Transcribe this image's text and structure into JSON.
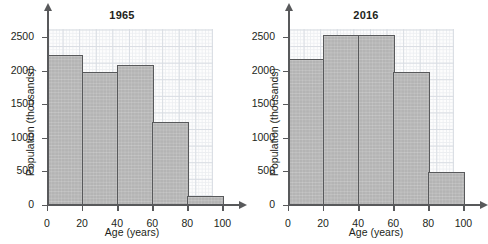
{
  "figure": {
    "panels": [
      {
        "title": "1965",
        "xlabel": "Age (years)",
        "ylabel": "Population (thousands)"
      },
      {
        "title": "2016",
        "xlabel": "Age (years)",
        "ylabel": "Population (thousands)"
      }
    ]
  },
  "axes": {
    "ytick_labels": [
      "0",
      "500",
      "1000",
      "1500",
      "2000",
      "2500"
    ],
    "xtick_labels": [
      "0",
      "20",
      "40",
      "60",
      "80",
      "100"
    ]
  },
  "colors": {
    "bar_fill": "#b4b4b4",
    "bar_stroke": "#58595b",
    "axis": "#58595b",
    "grid_major": "#d9dde3",
    "grid_minor": "#eceef1",
    "text": "#231f20"
  },
  "chart_data": [
    {
      "type": "bar",
      "title": "1965",
      "xlabel": "Age (years)",
      "ylabel": "Population (thousands)",
      "categories": [
        "0-20",
        "20-40",
        "40-60",
        "60-80",
        "80-100"
      ],
      "bin_edges": [
        0,
        20,
        40,
        60,
        80,
        100
      ],
      "values": [
        2250,
        2000,
        2100,
        1250,
        150
      ],
      "xlim": [
        0,
        110
      ],
      "ylim": [
        0,
        2700
      ],
      "xticks": [
        0,
        20,
        40,
        60,
        80,
        100
      ],
      "yticks": [
        0,
        500,
        1000,
        1500,
        2000,
        2500
      ],
      "grid": true,
      "legend": false
    },
    {
      "type": "bar",
      "title": "2016",
      "xlabel": "Age (years)",
      "ylabel": "Population (thousands)",
      "categories": [
        "0-20",
        "20-40",
        "40-60",
        "60-80",
        "80-100"
      ],
      "bin_edges": [
        0,
        20,
        40,
        60,
        80,
        100
      ],
      "values": [
        2200,
        2550,
        2550,
        2000,
        500
      ],
      "xlim": [
        0,
        110
      ],
      "ylim": [
        0,
        2700
      ],
      "xticks": [
        0,
        20,
        40,
        60,
        80,
        100
      ],
      "yticks": [
        0,
        500,
        1000,
        1500,
        2000,
        2500
      ],
      "grid": true,
      "legend": false
    }
  ]
}
